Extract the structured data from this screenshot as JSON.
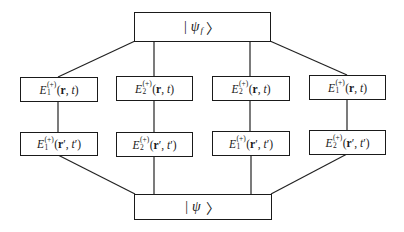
{
  "diagram": {
    "top_state": {
      "open": "|",
      "symbol": "ψ",
      "subscript": "f",
      "close": "〉"
    },
    "bottom_state": {
      "open": "|",
      "symbol": "ψ",
      "subscript": "",
      "close": "〉"
    },
    "columns": [
      {
        "upper": {
          "operator": "E",
          "superscript": "(+)",
          "subscript": "1",
          "args_open": "(",
          "pos": "r",
          "pos_prime": "",
          "sep": ", ",
          "time": "t",
          "time_prime": "",
          "args_close": ")"
        },
        "lower": {
          "operator": "E",
          "superscript": "(+)",
          "subscript": "1",
          "args_open": "(",
          "pos": "r",
          "pos_prime": "′",
          "sep": ", ",
          "time": "t",
          "time_prime": "′",
          "args_close": ")"
        }
      },
      {
        "upper": {
          "operator": "E",
          "superscript": "(+)",
          "subscript": "2",
          "args_open": "(",
          "pos": "r",
          "pos_prime": "",
          "sep": ", ",
          "time": "t",
          "time_prime": "",
          "args_close": ")"
        },
        "lower": {
          "operator": "E",
          "superscript": "(+)",
          "subscript": "2",
          "args_open": "(",
          "pos": "r",
          "pos_prime": "′",
          "sep": ", ",
          "time": "t",
          "time_prime": "′",
          "args_close": ")"
        }
      },
      {
        "upper": {
          "operator": "E",
          "superscript": "(+)",
          "subscript": "2",
          "args_open": "(",
          "pos": "r",
          "pos_prime": "",
          "sep": ", ",
          "time": "t",
          "time_prime": "",
          "args_close": ")"
        },
        "lower": {
          "operator": "E",
          "superscript": "(+)",
          "subscript": "1",
          "args_open": "(",
          "pos": "r",
          "pos_prime": "′",
          "sep": ", ",
          "time": "t",
          "time_prime": "′",
          "args_close": ")"
        }
      },
      {
        "upper": {
          "operator": "E",
          "superscript": "(+)",
          "subscript": "1",
          "args_open": "(",
          "pos": "r",
          "pos_prime": "",
          "sep": ", ",
          "time": "t",
          "time_prime": "",
          "args_close": ")"
        },
        "lower": {
          "operator": "E",
          "superscript": "(+)",
          "subscript": "2",
          "args_open": "(",
          "pos": "r",
          "pos_prime": "′",
          "sep": ", ",
          "time": "t",
          "time_prime": "′",
          "args_close": ")"
        }
      }
    ],
    "colors": {
      "line": "#222222",
      "border": "#1a1a1a",
      "background": "#ffffff",
      "text": "#1a1a1a"
    }
  }
}
